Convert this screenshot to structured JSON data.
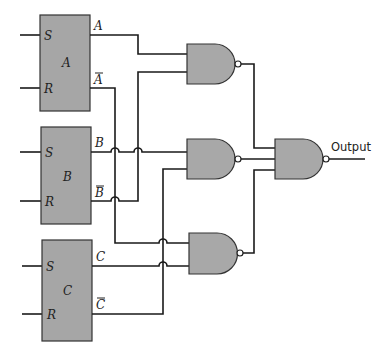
{
  "diagram": {
    "type": "logic-circuit",
    "flip_flops": [
      {
        "id": "A",
        "name_label": "A",
        "s_label": "S",
        "r_label": "R",
        "q_label": "A",
        "qbar_label": "A"
      },
      {
        "id": "B",
        "name_label": "B",
        "s_label": "S",
        "r_label": "R",
        "q_label": "B",
        "qbar_label": "B"
      },
      {
        "id": "C",
        "name_label": "C",
        "s_label": "S",
        "r_label": "R",
        "q_label": "C",
        "qbar_label": "C"
      }
    ],
    "gates": [
      {
        "id": "nand1",
        "type": "NAND",
        "inputs": [
          "A",
          "B̄"
        ]
      },
      {
        "id": "nand2",
        "type": "NAND",
        "inputs": [
          "B",
          "C̄"
        ]
      },
      {
        "id": "nand3",
        "type": "NAND",
        "inputs": [
          "Ā",
          "C"
        ]
      },
      {
        "id": "nand4",
        "type": "NAND",
        "inputs": [
          "nand1",
          "nand2",
          "nand3"
        ]
      }
    ],
    "output_label": "Output"
  },
  "colors": {
    "block_fill": "#a6a6a6",
    "gate_fill": "#a8a8a8",
    "wire": "#1a1a1a",
    "background": "#ffffff"
  }
}
